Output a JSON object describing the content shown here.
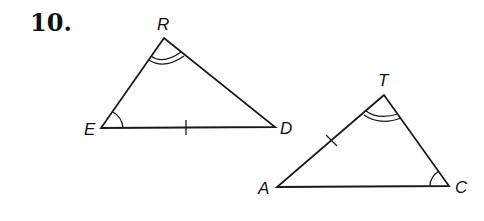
{
  "problem": {
    "number": "10."
  },
  "diagram": {
    "stroke_color": "#1a1a1a",
    "triangles": [
      {
        "name": "triangle-RED",
        "vertices": {
          "R": {
            "label": "R",
            "x": 164,
            "y": 38
          },
          "E": {
            "label": "E",
            "x": 101,
            "y": 128
          },
          "D": {
            "label": "D",
            "x": 275,
            "y": 127
          }
        },
        "marks": {
          "double_arc_angle": "R",
          "single_arc_angle": "E",
          "tick_side": "ED"
        }
      },
      {
        "name": "triangle-TAC",
        "vertices": {
          "T": {
            "label": "T",
            "x": 384,
            "y": 95
          },
          "A": {
            "label": "A",
            "x": 277,
            "y": 187
          },
          "C": {
            "label": "C",
            "x": 449,
            "y": 186
          }
        },
        "marks": {
          "double_arc_angle": "T",
          "single_arc_angle": "C",
          "tick_side": "AT"
        }
      }
    ]
  }
}
